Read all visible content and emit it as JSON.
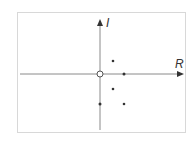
{
  "diagram": {
    "type": "complex-plane",
    "axes": {
      "real_label": "R",
      "imag_label": "I",
      "axis_color": "#8a8a8a",
      "origin_marker": "open-circle"
    },
    "points": [
      {
        "name": "origin",
        "x": 100,
        "y": 74,
        "style": "open"
      },
      {
        "name": "p1",
        "x": 113,
        "y": 61,
        "style": "filled"
      },
      {
        "name": "p2",
        "x": 124,
        "y": 74,
        "style": "filled"
      },
      {
        "name": "p3",
        "x": 113,
        "y": 89,
        "style": "filled"
      },
      {
        "name": "p4",
        "x": 100,
        "y": 104,
        "style": "filled"
      },
      {
        "name": "p5",
        "x": 124,
        "y": 104,
        "style": "filled"
      }
    ],
    "point_color": "#333333",
    "frame_color": "#d8d8d8"
  }
}
